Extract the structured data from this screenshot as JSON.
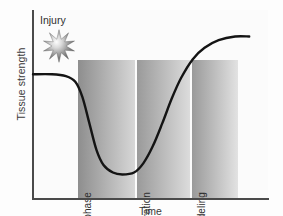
{
  "figure": {
    "background_color": "#fdfdfd",
    "axis_color": "#4a4a4a",
    "curve_color": "#141414"
  },
  "axes": {
    "ylabel": "Tissue strength",
    "xlabel": "Time"
  },
  "annotation": {
    "injury_label": "Injury",
    "injury_icon": "starburst-icon"
  },
  "bands": [
    {
      "label": "Lag phase",
      "x": 78,
      "width": 57,
      "color_dark": "#8e8e8e",
      "color_light": "#d7d7d7"
    },
    {
      "label": "Regeneration",
      "x": 137,
      "width": 53,
      "color_dark": "#9a9a9a",
      "color_light": "#dcdcdc"
    },
    {
      "label": "Remodeling",
      "x": 192,
      "width": 46,
      "color_dark": "#9a9a9a",
      "color_light": "#e2e2e2"
    }
  ],
  "chart_data": {
    "type": "line",
    "title": "",
    "xlabel": "Time",
    "ylabel": "Tissue strength",
    "xlim": [
      0,
      100
    ],
    "ylim": [
      0,
      100
    ],
    "grid": false,
    "legend": false,
    "axis_ticks": false,
    "annotations": [
      {
        "text": "Injury",
        "x": 8,
        "y": 88,
        "icon": "starburst"
      }
    ],
    "regions": [
      {
        "label": "Lag phase",
        "x_start": 19,
        "x_end": 43,
        "shading": "gradient-dark-to-light"
      },
      {
        "label": "Regeneration",
        "x_start": 44,
        "x_end": 67,
        "shading": "gradient-dark-to-light"
      },
      {
        "label": "Remodeling",
        "x_start": 68,
        "x_end": 87,
        "shading": "gradient-dark-to-light"
      }
    ],
    "series": [
      {
        "name": "Tissue strength",
        "x": [
          0,
          8,
          14,
          18,
          21,
          24,
          27,
          30,
          34,
          38,
          43,
          47,
          51,
          55,
          59,
          63,
          68,
          73,
          79,
          86,
          92
        ],
        "y": [
          66,
          66,
          65,
          62,
          54,
          40,
          26,
          18,
          14,
          13,
          14,
          19,
          28,
          40,
          53,
          64,
          74,
          80,
          84,
          86,
          86
        ]
      }
    ]
  }
}
